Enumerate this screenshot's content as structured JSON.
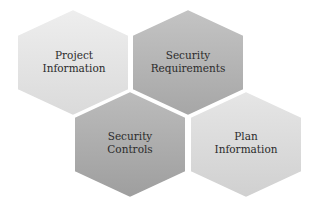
{
  "diagram": {
    "type": "hexagon-cluster",
    "nodes": [
      {
        "id": "project-information",
        "lines": [
          "Project",
          "Information"
        ],
        "center": [
          73,
          62
        ],
        "fill_top": "#eeeeee",
        "fill_bottom": "#dadada"
      },
      {
        "id": "security-requirements",
        "lines": [
          "Security",
          "Requirements"
        ],
        "center": [
          188,
          62
        ],
        "fill_top": "#c4c4c4",
        "fill_bottom": "#a6a6a6"
      },
      {
        "id": "security-controls",
        "lines": [
          "Security",
          "Controls"
        ],
        "center": [
          130,
          144
        ],
        "fill_top": "#bcbcbc",
        "fill_bottom": "#9e9e9e"
      },
      {
        "id": "plan-information",
        "lines": [
          "Plan",
          "Information"
        ],
        "center": [
          246,
          144
        ],
        "fill_top": "#e6e6e6",
        "fill_bottom": "#d0d0d0"
      }
    ],
    "colors": {
      "background": "#ffffff",
      "text": "#2b2b2b",
      "border": "#ffffff"
    }
  }
}
